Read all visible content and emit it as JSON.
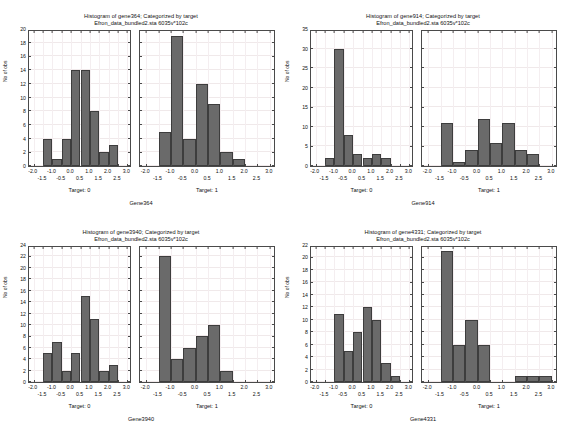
{
  "figure": {
    "subtitle": "Efron_data_bundled2.sta 6035v*102c",
    "ylabel": "No of obs",
    "bar_color": "#6a6a6a",
    "bar_edge_color": "#3d3d3d",
    "background": "#ffffff",
    "xtick_labels_row0": [
      "-2.0",
      "-1.0",
      "0.0",
      "1.0",
      "2.0",
      "3.0"
    ],
    "xtick_values_row0": [
      -2.0,
      -1.0,
      0.0,
      1.0,
      2.0,
      3.0
    ],
    "xtick_labels_row1": [
      "-1.5",
      "-0.5",
      "0.5",
      "1.5",
      "2.5"
    ],
    "xtick_values_row1": [
      -1.5,
      -0.5,
      0.5,
      1.5,
      2.5
    ]
  },
  "chart_data": [
    {
      "type": "bar",
      "title": "Histogram of gene364; Categorized by target",
      "subtitle": "Efron_data_bundled2.sta 6035v*102c",
      "gene_label": "Gene364",
      "xlabel": "",
      "ylabel": "No of obs",
      "ylim": [
        0,
        20
      ],
      "yticks": [
        0,
        2,
        4,
        6,
        8,
        10,
        12,
        14,
        16,
        18,
        20
      ],
      "xlim": [
        -2.25,
        3.25
      ],
      "grid": true,
      "panels": [
        {
          "name": "Target: 0",
          "bin_width": 0.5,
          "bin_starts": [
            -1.5,
            -1.0,
            -0.5,
            0.0,
            0.5,
            1.0,
            1.5,
            2.0
          ],
          "values": [
            4,
            1,
            4,
            14,
            14,
            8,
            2,
            3
          ]
        },
        {
          "name": "Target: 1",
          "bin_width": 0.5,
          "bin_starts": [
            -1.5,
            -1.0,
            -0.5,
            0.0,
            0.5,
            1.0,
            1.5
          ],
          "values": [
            5,
            19,
            4,
            12,
            9,
            2,
            1
          ]
        }
      ]
    },
    {
      "type": "bar",
      "title": "Histogram of gene914; Categorized by target",
      "subtitle": "Efron_data_bundled2.sta 6035v*102c",
      "gene_label": "Gene914",
      "xlabel": "",
      "ylabel": "No of obs",
      "ylim": [
        0,
        35
      ],
      "yticks": [
        0,
        5,
        10,
        15,
        20,
        25,
        30,
        35
      ],
      "xlim": [
        -2.25,
        3.25
      ],
      "grid": true,
      "panels": [
        {
          "name": "Target: 0",
          "bin_width": 0.5,
          "bin_starts": [
            -1.5,
            -1.0,
            -0.5,
            0.0,
            0.5,
            1.0,
            1.5
          ],
          "values": [
            2,
            30,
            8,
            3,
            2,
            3,
            2
          ]
        },
        {
          "name": "Target: 1",
          "bin_width": 0.5,
          "bin_starts": [
            -1.5,
            -1.0,
            -0.5,
            0.0,
            0.5,
            1.0,
            1.5,
            2.0
          ],
          "values": [
            11,
            1,
            4,
            12,
            6,
            11,
            4,
            3
          ]
        }
      ]
    },
    {
      "type": "bar",
      "title": "Histogram of gene3940; Categorized by target",
      "subtitle": "Efron_data_bundled2.sta 6035v*102c",
      "gene_label": "Gene3940",
      "xlabel": "",
      "ylabel": "No of obs",
      "ylim": [
        0,
        24
      ],
      "yticks": [
        0,
        2,
        4,
        6,
        8,
        10,
        12,
        14,
        16,
        18,
        20,
        22,
        24
      ],
      "xlim": [
        -2.25,
        3.25
      ],
      "grid": true,
      "panels": [
        {
          "name": "Target: 0",
          "bin_width": 0.5,
          "bin_starts": [
            -1.5,
            -1.0,
            -0.5,
            0.0,
            0.5,
            1.0,
            1.5,
            2.0
          ],
          "values": [
            5,
            7,
            2,
            5,
            15,
            11,
            2,
            3
          ]
        },
        {
          "name": "Target: 1",
          "bin_width": 0.5,
          "bin_starts": [
            -1.5,
            -1.0,
            -0.5,
            0.0,
            0.5,
            1.0
          ],
          "values": [
            22,
            4,
            6,
            8,
            10,
            2
          ]
        }
      ]
    },
    {
      "type": "bar",
      "title": "Histogram of gene4331; Categorized by target",
      "subtitle": "Efron_data_bundled2.sta 6035v*102c",
      "gene_label": "Gene4331",
      "xlabel": "",
      "ylabel": "No of obs",
      "ylim": [
        0,
        22
      ],
      "yticks": [
        0,
        2,
        4,
        6,
        8,
        10,
        12,
        14,
        16,
        18,
        20,
        22
      ],
      "xlim": [
        -2.25,
        3.25
      ],
      "grid": true,
      "panels": [
        {
          "name": "Target: 0",
          "bin_width": 0.5,
          "bin_starts": [
            -1.0,
            -0.5,
            0.0,
            0.5,
            1.0,
            1.5,
            2.0
          ],
          "values": [
            11,
            5,
            8,
            12,
            10,
            3,
            1
          ]
        },
        {
          "name": "Target: 1",
          "bin_width": 0.5,
          "bin_starts": [
            -1.5,
            -1.0,
            -0.5,
            0.0,
            1.5,
            2.0,
            2.5
          ],
          "values": [
            21,
            6,
            10,
            6,
            1,
            1,
            1
          ]
        }
      ]
    }
  ]
}
